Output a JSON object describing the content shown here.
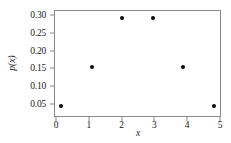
{
  "chart_data": {
    "type": "scatter",
    "title": "",
    "subtitle": "",
    "xlabel": "x",
    "ylabel": "p(x)",
    "x": [
      0,
      1,
      2,
      3,
      4,
      5
    ],
    "values": [
      0.03125,
      0.15625,
      0.3125,
      0.3125,
      0.15625,
      0.03125
    ],
    "series": [
      {
        "name": "p(x)",
        "x": [
          0,
          1,
          2,
          3,
          4,
          5
        ],
        "values": [
          0.03125,
          0.15625,
          0.3125,
          0.3125,
          0.15625,
          0.03125
        ]
      }
    ],
    "xtick_labels": [
      "0",
      "1",
      "2",
      "3",
      "4",
      "5"
    ],
    "xticks": [
      0,
      1,
      2,
      3,
      4,
      5
    ],
    "ytick_labels": [
      "0.05",
      "0.10",
      "0.15",
      "0.20",
      "0.25",
      "0.30"
    ],
    "yticks": [
      0.05,
      0.1,
      0.15,
      0.2,
      0.25,
      0.3
    ],
    "xlim": [
      -0.2,
      5.2
    ],
    "ylim": [
      0.0,
      0.335
    ],
    "grid": false,
    "legend": false,
    "legend_position": "none",
    "marker": "circle",
    "marker_color": "#0b0b0b",
    "frame_color": "#8a8a8a",
    "background_color": "#ffffff",
    "annotations": []
  }
}
